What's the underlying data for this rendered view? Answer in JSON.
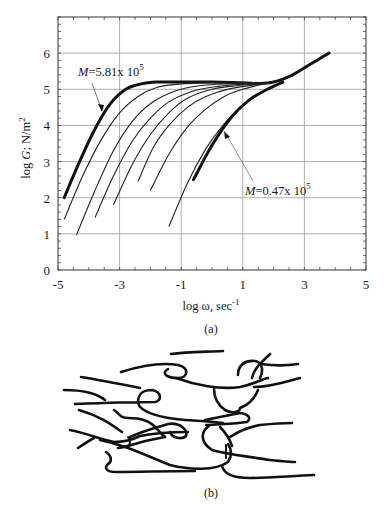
{
  "figure": {
    "panel_a_caption": "(a)",
    "panel_b_caption": "(b)"
  },
  "chart_data": {
    "type": "line",
    "title": "",
    "xlabel": "log ω, sec⁻¹",
    "xlabel_main": "log ω,  sec",
    "xlabel_sup": "-1",
    "ylabel": "log G′; N/m²",
    "ylabel_prefix": "log ",
    "ylabel_var": "G",
    "ylabel_unit": "; N/m",
    "ylabel_sup": "2",
    "xlim": [
      -5,
      5
    ],
    "ylim": [
      0,
      7
    ],
    "xticks": [
      "-5",
      "-3",
      "-1",
      "1",
      "3",
      "5"
    ],
    "yticks": [
      "0",
      "1",
      "2",
      "3",
      "4",
      "5",
      "6"
    ],
    "grid": true,
    "legend": "none",
    "annotations": [
      {
        "text_var": "M",
        "text": "=5.81x 10",
        "sup": "5",
        "points_to": "highest molecular weight curve (thick, leftmost)"
      },
      {
        "text_var": "M",
        "text": "=0.47x 10",
        "sup": "5",
        "points_to": "lowest molecular weight curve (thick, rightmost)"
      }
    ],
    "series": [
      {
        "name": "M=5.81x10^5",
        "thick": true,
        "x": [
          -4.8,
          -4.3,
          -3.8,
          -3.3,
          -2.8,
          -2.3,
          -1.8,
          -1.0,
          0.0,
          1.0,
          1.8,
          2.5,
          3.2,
          3.8
        ],
        "y": [
          2.0,
          3.0,
          3.9,
          4.6,
          5.0,
          5.15,
          5.2,
          5.2,
          5.2,
          5.18,
          5.17,
          5.35,
          5.7,
          6.0
        ]
      },
      {
        "name": "curve-2",
        "x": [
          -4.8,
          -4.2,
          -3.6,
          -3.0,
          -2.4,
          -1.8,
          -1.0,
          0.0,
          1.0,
          1.8
        ],
        "y": [
          1.4,
          2.6,
          3.6,
          4.35,
          4.8,
          5.05,
          5.15,
          5.18,
          5.18,
          5.17
        ]
      },
      {
        "name": "curve-3",
        "x": [
          -4.4,
          -3.8,
          -3.2,
          -2.6,
          -2.0,
          -1.2,
          -0.4,
          0.6,
          1.8
        ],
        "y": [
          0.97,
          2.2,
          3.3,
          4.1,
          4.6,
          4.95,
          5.1,
          5.15,
          5.17
        ]
      },
      {
        "name": "curve-4",
        "x": [
          -3.8,
          -3.2,
          -2.6,
          -2.0,
          -1.4,
          -0.6,
          0.2,
          1.0,
          1.8
        ],
        "y": [
          1.45,
          2.6,
          3.55,
          4.2,
          4.65,
          4.95,
          5.08,
          5.14,
          5.17
        ]
      },
      {
        "name": "curve-5",
        "x": [
          -3.2,
          -2.6,
          -2.0,
          -1.4,
          -0.8,
          0.0,
          0.8,
          1.8
        ],
        "y": [
          1.8,
          2.9,
          3.75,
          4.35,
          4.75,
          5.0,
          5.1,
          5.17
        ]
      },
      {
        "name": "curve-6",
        "x": [
          -2.4,
          -1.9,
          -1.4,
          -0.8,
          -0.2,
          0.6,
          1.8
        ],
        "y": [
          2.45,
          3.4,
          4.0,
          4.5,
          4.8,
          5.02,
          5.17
        ]
      },
      {
        "name": "curve-7",
        "x": [
          -2.0,
          -1.4,
          -0.8,
          -0.2,
          0.4,
          1.0,
          1.8
        ],
        "y": [
          2.2,
          3.2,
          3.95,
          4.45,
          4.8,
          5.0,
          5.17
        ]
      },
      {
        "name": "curve-8",
        "x": [
          -1.4,
          -0.8,
          -0.2,
          0.4,
          1.0,
          1.6,
          2.2
        ],
        "y": [
          1.2,
          2.4,
          3.35,
          4.05,
          4.55,
          4.9,
          5.18
        ]
      },
      {
        "name": "M=0.47x10^5",
        "thick": true,
        "x": [
          -0.6,
          0.0,
          0.6,
          1.2,
          1.8,
          2.3
        ],
        "y": [
          2.5,
          3.45,
          4.2,
          4.7,
          5.0,
          5.2
        ]
      }
    ]
  }
}
